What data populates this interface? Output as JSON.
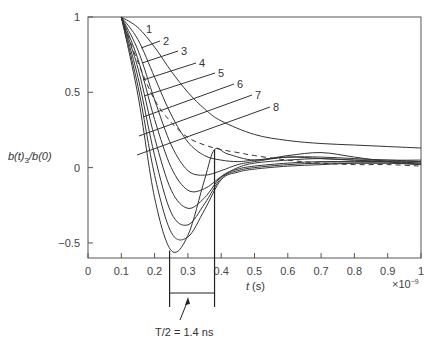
{
  "chart_data": {
    "type": "line",
    "title": "",
    "xlabel": "t (s)",
    "ylabel": "b(t)_3/b(0)",
    "x_multiplier": "×10^-9",
    "xlim": [
      0,
      1
    ],
    "ylim": [
      -0.6,
      1
    ],
    "grid": false,
    "x_ticks": [
      "0",
      "0.1",
      "0.2",
      "0.3",
      "0.4",
      "0.5",
      "0.6",
      "0.7",
      "0.8",
      "0.9",
      "1"
    ],
    "y_ticks": [
      "-0.5",
      "0",
      "0.5",
      "1"
    ],
    "annotation": {
      "text": "T/2 = 1.4 ns",
      "bracket_x_start": 0.245,
      "bracket_x_end": 0.38
    },
    "series": [
      {
        "name": "1",
        "style": "solid",
        "x": [
          0.1,
          0.15,
          0.2,
          0.25,
          0.3,
          0.35,
          0.4,
          0.5,
          0.6,
          0.7,
          0.8,
          0.9,
          1.0
        ],
        "y": [
          1.0,
          0.93,
          0.8,
          0.64,
          0.5,
          0.39,
          0.31,
          0.22,
          0.18,
          0.16,
          0.15,
          0.14,
          0.13
        ]
      },
      {
        "name": "2",
        "style": "solid",
        "x": [
          0.1,
          0.15,
          0.2,
          0.25,
          0.3,
          0.35,
          0.4,
          0.45,
          0.5,
          0.6,
          0.7,
          0.8,
          0.9,
          1.0
        ],
        "y": [
          1.0,
          0.85,
          0.6,
          0.35,
          0.17,
          0.08,
          0.05,
          0.04,
          0.05,
          0.07,
          0.07,
          0.06,
          0.05,
          0.05
        ]
      },
      {
        "name": "3",
        "style": "solid",
        "x": [
          0.1,
          0.15,
          0.2,
          0.25,
          0.3,
          0.35,
          0.4,
          0.45,
          0.5,
          0.6,
          0.7,
          0.8,
          0.9,
          1.0
        ],
        "y": [
          1.0,
          0.78,
          0.45,
          0.15,
          -0.02,
          -0.05,
          -0.02,
          0.02,
          0.04,
          0.07,
          0.06,
          0.05,
          0.05,
          0.04
        ]
      },
      {
        "name": "4",
        "style": "solid",
        "x": [
          0.1,
          0.15,
          0.2,
          0.25,
          0.3,
          0.35,
          0.4,
          0.45,
          0.5,
          0.6,
          0.7,
          0.8,
          0.9,
          1.0
        ],
        "y": [
          1.0,
          0.72,
          0.32,
          0.0,
          -0.15,
          -0.14,
          -0.06,
          0.0,
          0.03,
          0.05,
          0.06,
          0.05,
          0.04,
          0.04
        ]
      },
      {
        "name": "5",
        "style": "solid",
        "x": [
          0.1,
          0.15,
          0.2,
          0.25,
          0.3,
          0.35,
          0.4,
          0.45,
          0.5,
          0.6,
          0.7,
          0.8,
          0.9,
          1.0
        ],
        "y": [
          1.0,
          0.66,
          0.2,
          -0.15,
          -0.27,
          -0.2,
          -0.06,
          -0.01,
          0.01,
          0.03,
          0.04,
          0.04,
          0.04,
          0.03
        ]
      },
      {
        "name": "6",
        "style": "solid",
        "x": [
          0.1,
          0.15,
          0.2,
          0.25,
          0.3,
          0.35,
          0.4,
          0.45,
          0.5,
          0.6,
          0.7,
          0.8,
          0.9,
          1.0
        ],
        "y": [
          1.0,
          0.6,
          0.08,
          -0.3,
          -0.38,
          -0.24,
          -0.07,
          -0.02,
          0.0,
          0.02,
          0.03,
          0.03,
          0.03,
          0.03
        ]
      },
      {
        "name": "7",
        "style": "solid",
        "x": [
          0.1,
          0.15,
          0.2,
          0.25,
          0.3,
          0.35,
          0.4,
          0.45,
          0.5,
          0.6,
          0.7,
          0.8,
          0.9,
          1.0
        ],
        "y": [
          1.0,
          0.54,
          -0.05,
          -0.43,
          -0.46,
          -0.28,
          -0.08,
          -0.03,
          -0.01,
          0.01,
          0.02,
          0.03,
          0.03,
          0.02
        ]
      },
      {
        "name": "8",
        "style": "solid",
        "x": [
          0.1,
          0.15,
          0.2,
          0.25,
          0.3,
          0.35,
          0.38,
          0.42,
          0.5,
          0.6,
          0.7,
          0.8,
          0.9,
          1.0
        ],
        "y": [
          1.0,
          0.48,
          -0.2,
          -0.55,
          -0.45,
          -0.08,
          0.12,
          0.09,
          0.05,
          0.08,
          0.1,
          0.07,
          0.04,
          0.02
        ]
      },
      {
        "name": "dashed",
        "style": "dashed",
        "x": [
          0.1,
          0.15,
          0.2,
          0.25,
          0.3,
          0.35,
          0.4,
          0.45,
          0.5,
          0.6,
          0.7,
          0.8,
          0.9,
          1.0
        ],
        "y": [
          1.0,
          0.7,
          0.45,
          0.3,
          0.2,
          0.15,
          0.12,
          0.1,
          0.08,
          0.05,
          0.03,
          0.02,
          0.02,
          0.01
        ]
      }
    ]
  }
}
